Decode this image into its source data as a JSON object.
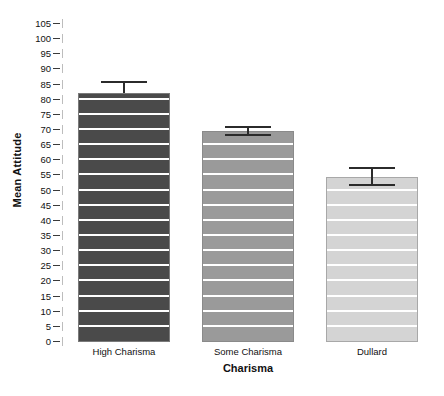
{
  "chart_data": {
    "type": "bar",
    "title": "",
    "xlabel": "Charisma",
    "ylabel": "Mean Attitude",
    "categories": [
      "High Charisma",
      "Some Charisma",
      "Dullard"
    ],
    "values": [
      82.3,
      69.6,
      54.6
    ],
    "error_upper": [
      86.2,
      71.4,
      57.8
    ],
    "error_lower": [
      82.3,
      67.9,
      51.5
    ],
    "ylim": [
      0,
      105
    ],
    "ytick_step": 5,
    "ytick_labels": [
      "0",
      "5",
      "10",
      "15",
      "20",
      "25",
      "30",
      "35",
      "40",
      "45",
      "50",
      "55",
      "60",
      "65",
      "70",
      "75",
      "80",
      "85",
      "90",
      "95",
      "100",
      "105"
    ],
    "grid": false,
    "legend": "none",
    "bar_colors": [
      "#4a4a4a",
      "#9a9a9a",
      "#d4d4d4"
    ],
    "stripe_color": "#ffffff",
    "error_bar_color": "#2b2b2b",
    "background": "#ffffff"
  }
}
